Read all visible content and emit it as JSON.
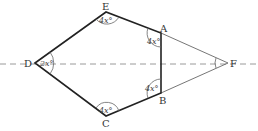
{
  "diagram": {
    "vertices": {
      "A": {
        "label": "A",
        "x": 161,
        "y": 33
      },
      "B": {
        "label": "B",
        "x": 161,
        "y": 93
      },
      "C": {
        "label": "C",
        "x": 106,
        "y": 116
      },
      "D": {
        "label": "D",
        "x": 35,
        "y": 63
      },
      "E": {
        "label": "E",
        "x": 106,
        "y": 12
      },
      "F": {
        "label": "F",
        "x": 228,
        "y": 63
      }
    },
    "angles": {
      "E": "4x°",
      "A": "4x°",
      "B": "4x°",
      "C": "4x°",
      "D": "2x°"
    },
    "axis_line": {
      "style": "dashed",
      "y": 64
    },
    "colors": {
      "pentagon_stroke": "#222222",
      "thin_stroke": "#666666",
      "dashed": "#999999"
    }
  }
}
